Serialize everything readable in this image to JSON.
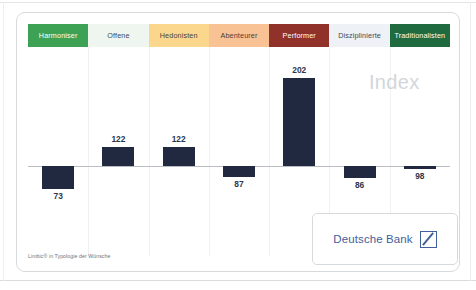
{
  "card": {
    "index_watermark": "Index",
    "source_note": "Limbic® in Typologie der Wünsche"
  },
  "segments": [
    {
      "label": "Harmoniser",
      "bg": "#3da254",
      "fg": "#ffffff"
    },
    {
      "label": "Offene",
      "bg": "#eef6ef",
      "fg": "#3f4654"
    },
    {
      "label": "Hedonisten",
      "bg": "#fbd78e",
      "fg": "#4a4436"
    },
    {
      "label": "Abenteurer",
      "bg": "#f9c294",
      "fg": "#4a4034"
    },
    {
      "label": "Performer",
      "bg": "#90312a",
      "fg": "#ffffff"
    },
    {
      "label": "Disziplinierte",
      "bg": "#eef1f6",
      "fg": "#3f4654"
    },
    {
      "label": "Traditionalisten",
      "bg": "#1f6b3f",
      "fg": "#ffffff"
    }
  ],
  "logo": {
    "text": "Deutsche Bank",
    "mark_name": "deutsche-bank-slash-mark",
    "color": "#41619e"
  },
  "chart_data": {
    "type": "bar",
    "title": "Index",
    "subtitle": "",
    "xlabel": "",
    "ylabel": "Index",
    "baseline": 100,
    "grid": false,
    "legend": "none",
    "bar_color": "#20293f",
    "categories": [
      "Harmoniser",
      "Offene",
      "Hedonisten",
      "Abenteurer",
      "Performer",
      "Disziplinierte",
      "Traditionalisten"
    ],
    "values": [
      73,
      122,
      122,
      87,
      202,
      86,
      98
    ],
    "labels": [
      "73",
      "122",
      "122",
      "87",
      "202",
      "86",
      "98"
    ],
    "ylim": [
      60,
      210
    ],
    "note": "Bars are drawn as deviation from an index baseline of 100; values below 100 extend downward, values above 100 extend upward."
  }
}
